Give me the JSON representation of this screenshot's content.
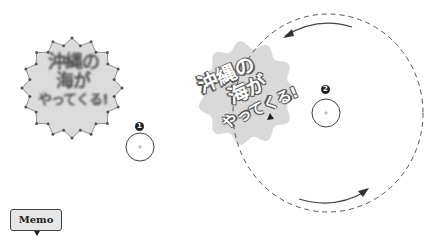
{
  "left_shape": {
    "lines": [
      "沖縄の",
      "海が",
      "やってくる!"
    ],
    "fill": "#dcdcdc",
    "text_color": "#4a4a4a",
    "state": "editing-with-control-points"
  },
  "right_shape": {
    "lines": [
      "沖縄の",
      "海が",
      "やってくる!"
    ],
    "fill": "#d9d9d9"
  },
  "markers": [
    {
      "label": "1"
    },
    {
      "label": "2"
    }
  ],
  "rotation_guide": {
    "style": "dashed-circle",
    "arrows": [
      "counterclockwise-top",
      "clockwise-bottom"
    ]
  },
  "memo_button": {
    "label": "Memo"
  },
  "colors": {
    "stroke": "#555555",
    "shape_fill": "#dcdcdc",
    "badge": "#222222"
  }
}
